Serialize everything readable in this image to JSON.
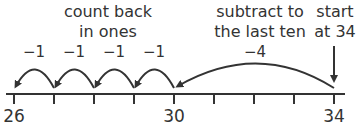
{
  "diagram": {
    "type": "number-line-subtraction",
    "annotations": {
      "count_back": [
        "count back",
        "in ones"
      ],
      "subtract_last_ten": [
        "subtract to",
        "the last ten"
      ],
      "start": [
        "start",
        "at 34"
      ]
    },
    "jumps": [
      {
        "from": 34,
        "to": 30,
        "label": "−4"
      },
      {
        "from": 30,
        "to": 29,
        "label": "−1"
      },
      {
        "from": 29,
        "to": 28,
        "label": "−1"
      },
      {
        "from": 28,
        "to": 27,
        "label": "−1"
      },
      {
        "from": 27,
        "to": 26,
        "label": "−1"
      }
    ],
    "number_line": {
      "min": 26,
      "max": 34,
      "labeled_ticks": [
        "26",
        "30",
        "34"
      ]
    },
    "colors": {
      "ink": "#333333",
      "background": "#ffffff"
    }
  }
}
